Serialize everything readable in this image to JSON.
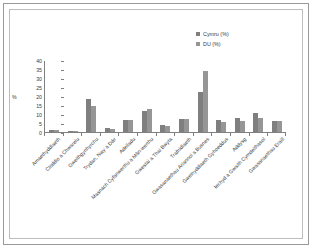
{
  "chart_data": {
    "type": "bar",
    "title": "",
    "subtitle": "",
    "xlabel": "",
    "ylabel": "%",
    "ylim": [
      0,
      40
    ],
    "yticks": [
      0,
      5,
      10,
      15,
      20,
      25,
      30,
      35,
      40
    ],
    "grid": false,
    "legend_position": "top-right",
    "categories": [
      "Amaethyddiaeth",
      "Cloddio a Chwarelu",
      "Gweithgynhyrchu",
      "Trydan, Nwy a Dŵr",
      "Adeiladu",
      "Masnach Cyfanwerthu a Mân-werthu",
      "Gwestai a Thai Bwyta",
      "Trafnidiaeth",
      "Gwasanaethau Ariannol a Busnes",
      "Gweinyddiaeth Gyhoeddus",
      "Addysg",
      "Iechyd a Gwaith Cymdeithasol",
      "Gwasanaethau Eraill"
    ],
    "series": [
      {
        "name": "Cymru (%)",
        "color": "#7f7f7f",
        "values": [
          1.3,
          0.3,
          18.5,
          2.2,
          6.5,
          11.4,
          3.7,
          7.4,
          22.0,
          6.9,
          7.9,
          10.8,
          5.9
        ]
      },
      {
        "name": "DU (%)",
        "color": "#969696",
        "values": [
          0.9,
          0.2,
          14.7,
          1.8,
          6.4,
          12.6,
          3.4,
          7.4,
          33.7,
          5.8,
          6.3,
          7.8,
          5.9
        ]
      }
    ]
  },
  "legend": {
    "items": [
      {
        "label": "Cymru (%)",
        "color": "#7f7f7f"
      },
      {
        "label": "DU (%)",
        "color": "#969696"
      }
    ]
  },
  "axis": {
    "y_title": "%",
    "y_labels": [
      "40",
      "35",
      "30",
      "25",
      "20",
      "15",
      "10",
      "5",
      "0"
    ]
  }
}
